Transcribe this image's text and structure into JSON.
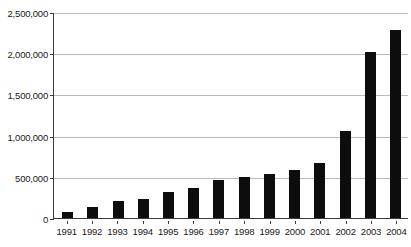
{
  "chart_data": {
    "type": "bar",
    "title": "",
    "subtitle": "",
    "xlabel": "",
    "ylabel": "",
    "categories": [
      "1991",
      "1992",
      "1993",
      "1994",
      "1995",
      "1996",
      "1997",
      "1998",
      "1999",
      "2000",
      "2001",
      "2002",
      "2003",
      "2004"
    ],
    "values": [
      73000,
      138000,
      206000,
      230000,
      315000,
      360000,
      465000,
      500000,
      540000,
      580000,
      663000,
      1060000,
      2010000,
      2280000
    ],
    "series": [
      {
        "name": "",
        "values": [
          73000,
          138000,
          206000,
          230000,
          315000,
          360000,
          465000,
          500000,
          540000,
          580000,
          663000,
          1060000,
          2010000,
          2280000
        ]
      }
    ],
    "ylim": [
      0,
      2500000
    ],
    "ytick_values": [
      0,
      500000,
      1000000,
      1500000,
      2000000,
      2500000
    ],
    "ytick_labels": [
      "0",
      "500,000",
      "1,000,000",
      "1,500,000",
      "2,000,000",
      "2,500,000"
    ],
    "grid": true,
    "grid_axis": "y",
    "legend": false,
    "legend_position": "none",
    "bar_color": "#0d0d0d",
    "grid_color": "#b9b9b9",
    "axis_color": "#3b3b3b",
    "background_color": "#ffffff",
    "annotations": []
  }
}
